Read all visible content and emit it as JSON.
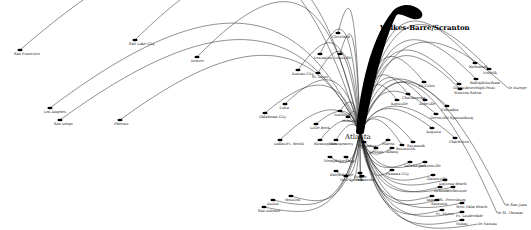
{
  "map": {
    "hub": {
      "name": "Atlanta",
      "x": 360,
      "y": 132
    },
    "major_flow": {
      "name": "Wilkes-Barre/Scranton",
      "label_x": 368,
      "label_y": 24
    },
    "cities": [
      {
        "name": "San Francisco",
        "x": 20,
        "y": 50,
        "side": "w"
      },
      {
        "name": "Salt Lake City",
        "x": 135,
        "y": 40,
        "side": "w"
      },
      {
        "name": "Denver",
        "x": 197,
        "y": 57,
        "side": "w"
      },
      {
        "name": "Los Angeles",
        "x": 50,
        "y": 108,
        "side": "w"
      },
      {
        "name": "San Diego",
        "x": 60,
        "y": 120,
        "side": "w"
      },
      {
        "name": "Phoenix",
        "x": 120,
        "y": 120,
        "side": "w"
      },
      {
        "name": "Cleveland",
        "x": 338,
        "y": 33,
        "side": "n"
      },
      {
        "name": "Lexington",
        "x": 320,
        "y": 54,
        "side": "n"
      },
      {
        "name": "Louisville",
        "x": 340,
        "y": 54,
        "side": "n"
      },
      {
        "name": "Kansas City",
        "x": 298,
        "y": 70,
        "side": "w"
      },
      {
        "name": "St. Louis",
        "x": 318,
        "y": 73,
        "side": "w"
      },
      {
        "name": "Oklahoma City",
        "x": 265,
        "y": 113,
        "side": "w"
      },
      {
        "name": "Tulsa",
        "x": 285,
        "y": 104,
        "side": "w"
      },
      {
        "name": "Little Rock",
        "x": 316,
        "y": 124,
        "side": "w"
      },
      {
        "name": "Dallas/Ft. Worth",
        "x": 280,
        "y": 140,
        "side": "w"
      },
      {
        "name": "Austin",
        "x": 273,
        "y": 200,
        "side": "s"
      },
      {
        "name": "Houston",
        "x": 291,
        "y": 196,
        "side": "s"
      },
      {
        "name": "San Antonio",
        "x": 264,
        "y": 207,
        "side": "s"
      },
      {
        "name": "Memphis",
        "x": 330,
        "y": 157,
        "side": "s"
      },
      {
        "name": "Jackson",
        "x": 346,
        "y": 157,
        "side": "s"
      },
      {
        "name": "Baton Rouge",
        "x": 336,
        "y": 171,
        "side": "s"
      },
      {
        "name": "New Orleans",
        "x": 346,
        "y": 176,
        "side": "s"
      },
      {
        "name": "Mobile",
        "x": 360,
        "y": 173,
        "side": "s"
      },
      {
        "name": "Pensacola",
        "x": 362,
        "y": 176,
        "side": "s"
      },
      {
        "name": "Panama City",
        "x": 392,
        "y": 170,
        "side": "s"
      },
      {
        "name": "Tallahassee",
        "x": 410,
        "y": 162,
        "side": "s"
      },
      {
        "name": "Jacksonville",
        "x": 425,
        "y": 162,
        "side": "s"
      },
      {
        "name": "Gainesville",
        "x": 433,
        "y": 175,
        "side": "s"
      },
      {
        "name": "Daytona Beach",
        "x": 445,
        "y": 180,
        "side": "s"
      },
      {
        "name": "Orlando",
        "x": 440,
        "y": 187,
        "side": "s"
      },
      {
        "name": "Melbourne",
        "x": 453,
        "y": 187,
        "side": "s"
      },
      {
        "name": "Tampa/St. Petersburg",
        "x": 432,
        "y": 196,
        "side": "s"
      },
      {
        "name": "Sarasota",
        "x": 437,
        "y": 200,
        "side": "s"
      },
      {
        "name": "Ft. Myers",
        "x": 442,
        "y": 210,
        "side": "s"
      },
      {
        "name": "West Palm Beach",
        "x": 462,
        "y": 203,
        "side": "s"
      },
      {
        "name": "Ft. Lauderdale",
        "x": 462,
        "y": 212,
        "side": "s"
      },
      {
        "name": "Miami",
        "x": 462,
        "y": 220,
        "side": "s"
      },
      {
        "name": "To Nassau",
        "x": 478,
        "y": 224,
        "side": "s"
      },
      {
        "name": "To San Juan",
        "x": 505,
        "y": 205,
        "side": "e"
      },
      {
        "name": "To St. Thomas",
        "x": 497,
        "y": 213,
        "side": "e"
      },
      {
        "name": "Savannah",
        "x": 413,
        "y": 142,
        "side": "e"
      },
      {
        "name": "Brunswick",
        "x": 402,
        "y": 145,
        "side": "e"
      },
      {
        "name": "Charleston",
        "x": 455,
        "y": 138,
        "side": "e"
      },
      {
        "name": "Augusta",
        "x": 432,
        "y": 128,
        "side": "e"
      },
      {
        "name": "Columbia",
        "x": 447,
        "y": 106,
        "side": "e"
      },
      {
        "name": "Greenville-Spartanburg",
        "x": 436,
        "y": 114,
        "side": "e"
      },
      {
        "name": "Asheville",
        "x": 425,
        "y": 100,
        "side": "e"
      },
      {
        "name": "Tri-Cities",
        "x": 424,
        "y": 82,
        "side": "e"
      },
      {
        "name": "Knoxville",
        "x": 397,
        "y": 100,
        "side": "e"
      },
      {
        "name": "Chattanooga",
        "x": 408,
        "y": 94,
        "side": "e"
      },
      {
        "name": "Greensboro/High Point",
        "x": 459,
        "y": 84,
        "side": "e"
      },
      {
        "name": "Winston-Salem",
        "x": 460,
        "y": 89,
        "side": "e"
      },
      {
        "name": "Raleigh/Durham",
        "x": 476,
        "y": 79,
        "side": "e"
      },
      {
        "name": "Richmond",
        "x": 475,
        "y": 63,
        "side": "e"
      },
      {
        "name": "Norfolk",
        "x": 489,
        "y": 69,
        "side": "e"
      },
      {
        "name": "To Europe",
        "x": 508,
        "y": 88,
        "side": "e"
      },
      {
        "name": "Nashville",
        "x": 340,
        "y": 111,
        "side": "n"
      },
      {
        "name": "Huntsville",
        "x": 348,
        "y": 117,
        "side": "n"
      },
      {
        "name": "Birmingham",
        "x": 320,
        "y": 140,
        "side": "w"
      },
      {
        "name": "Montgomery",
        "x": 336,
        "y": 140,
        "side": "w"
      },
      {
        "name": "Columbus",
        "x": 364,
        "y": 142,
        "side": "s"
      },
      {
        "name": "Macon",
        "x": 388,
        "y": 140,
        "side": "s"
      },
      {
        "name": "Albany",
        "x": 392,
        "y": 148,
        "side": "s"
      },
      {
        "name": "Dothan",
        "x": 376,
        "y": 148,
        "side": "s"
      }
    ]
  }
}
